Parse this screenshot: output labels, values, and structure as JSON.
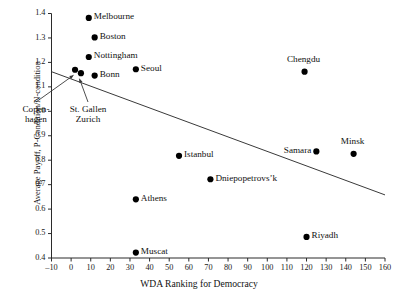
{
  "chart_data": {
    "type": "scatter",
    "title": "",
    "xlabel": "WDA Ranking for Democracy",
    "ylabel": "Average Payoff, P-Condition/N-condition",
    "xlim": [
      -10,
      160
    ],
    "ylim": [
      0.4,
      1.4
    ],
    "xticks": [
      -10,
      0,
      10,
      20,
      30,
      40,
      50,
      60,
      70,
      80,
      90,
      100,
      110,
      120,
      130,
      140,
      150,
      160
    ],
    "yticks": [
      "1.4",
      "1.3",
      "1.2",
      "1.1",
      "1.0",
      "0.9",
      "0.8",
      "0.7",
      "0.6",
      "0.5",
      "0.4"
    ],
    "xtick_labels": [
      "–10",
      "0",
      "10",
      "20",
      "30",
      "40",
      "50",
      "60",
      "70",
      "80",
      "90",
      "100",
      "110",
      "120",
      "130",
      "140",
      "150",
      "160"
    ],
    "grid": false,
    "legend": "none",
    "marker_color": "#000000",
    "trendline_color": "#3a3a3a",
    "points": [
      {
        "label": "Melbourne",
        "x": 9,
        "y": 1.382,
        "label_pos": "right"
      },
      {
        "label": "Boston",
        "x": 12,
        "y": 1.302,
        "label_pos": "right"
      },
      {
        "label": "Nottingham",
        "x": 9,
        "y": 1.222,
        "label_pos": "right"
      },
      {
        "label": "Seoul",
        "x": 33,
        "y": 1.172,
        "label_pos": "right"
      },
      {
        "label": "Copenhagen",
        "x": 2,
        "y": 1.17,
        "label_pos": "annotated"
      },
      {
        "label": "St. Gallen",
        "x": 5,
        "y": 1.156,
        "label_pos": "annotated"
      },
      {
        "label": "Bonn",
        "x": 12,
        "y": 1.146,
        "label_pos": "right"
      },
      {
        "label": "Chengdu",
        "x": 119,
        "y": 1.162,
        "label_pos": "above"
      },
      {
        "label": "Samara",
        "x": 125,
        "y": 0.836,
        "label_pos": "left"
      },
      {
        "label": "Minsk",
        "x": 144,
        "y": 0.826,
        "label_pos": "above"
      },
      {
        "label": "Istanbul",
        "x": 55,
        "y": 0.818,
        "label_pos": "right"
      },
      {
        "label": "Dniepopetrovs’k",
        "x": 71,
        "y": 0.722,
        "label_pos": "right"
      },
      {
        "label": "Athens",
        "x": 33,
        "y": 0.64,
        "label_pos": "right"
      },
      {
        "label": "Riyadh",
        "x": 120,
        "y": 0.486,
        "label_pos": "right"
      },
      {
        "label": "Muscat",
        "x": 33,
        "y": 0.422,
        "label_pos": "right"
      }
    ],
    "trendline": {
      "x0": -10,
      "y0": 1.162,
      "x1": 160,
      "y1": 0.658
    },
    "annotations": [
      {
        "id": "copenhagen",
        "line1": "Copen-",
        "line2": "hagen",
        "target": "Copenhagen"
      },
      {
        "id": "stgallen",
        "line1": "St. Gallen",
        "line2": "Zurich",
        "target": "St. Gallen"
      }
    ]
  }
}
